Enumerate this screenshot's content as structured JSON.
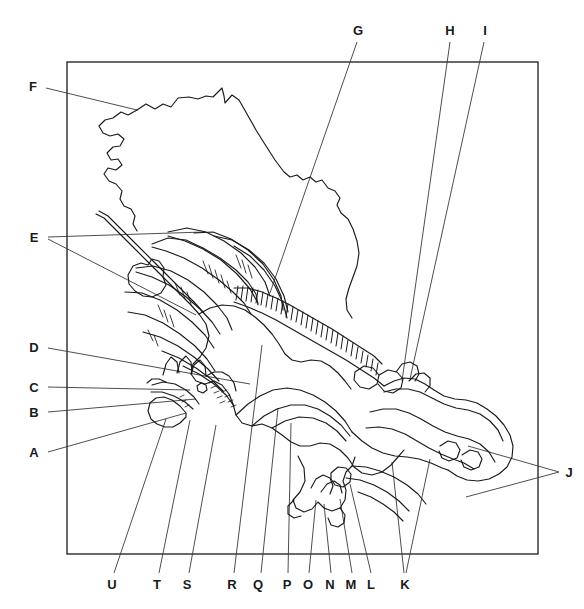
{
  "figure": {
    "type": "anatomical-line-drawing",
    "title": "",
    "caption": "",
    "style": {
      "background": "#ffffff",
      "line_color": "#1a1a1a",
      "leader_color": "#3a3a3a",
      "frame_color": "#2b2b2b"
    },
    "frame": {
      "x": 67,
      "y": 62,
      "width": 471,
      "height": 492
    },
    "labels": [
      {
        "id": "F",
        "text": "F",
        "x": 33,
        "y": 86,
        "position": "left"
      },
      {
        "id": "E",
        "text": "E",
        "x": 34,
        "y": 237,
        "position": "left"
      },
      {
        "id": "D",
        "text": "D",
        "x": 34,
        "y": 347,
        "position": "left"
      },
      {
        "id": "C",
        "text": "C",
        "x": 34,
        "y": 387,
        "position": "left"
      },
      {
        "id": "B",
        "text": "B",
        "x": 34,
        "y": 412,
        "position": "left"
      },
      {
        "id": "A",
        "text": "A",
        "x": 34,
        "y": 452,
        "position": "left"
      },
      {
        "id": "G",
        "text": "G",
        "x": 358,
        "y": 30,
        "position": "top"
      },
      {
        "id": "H",
        "text": "H",
        "x": 450,
        "y": 30,
        "position": "top"
      },
      {
        "id": "I",
        "text": "I",
        "x": 485,
        "y": 30,
        "position": "top"
      },
      {
        "id": "J",
        "text": "J",
        "x": 569,
        "y": 472,
        "position": "right"
      },
      {
        "id": "K",
        "text": "K",
        "x": 405,
        "y": 584,
        "position": "bottom"
      },
      {
        "id": "L",
        "text": "L",
        "x": 371,
        "y": 584,
        "position": "bottom"
      },
      {
        "id": "M",
        "text": "M",
        "x": 351,
        "y": 584,
        "position": "bottom"
      },
      {
        "id": "N",
        "text": "N",
        "x": 330,
        "y": 584,
        "position": "bottom"
      },
      {
        "id": "O",
        "text": "O",
        "x": 308,
        "y": 584,
        "position": "bottom"
      },
      {
        "id": "P",
        "text": "P",
        "x": 287,
        "y": 584,
        "position": "bottom"
      },
      {
        "id": "Q",
        "text": "Q",
        "x": 258,
        "y": 584,
        "position": "bottom"
      },
      {
        "id": "R",
        "text": "R",
        "x": 232,
        "y": 584,
        "position": "bottom"
      },
      {
        "id": "S",
        "text": "S",
        "x": 187,
        "y": 584,
        "position": "bottom"
      },
      {
        "id": "T",
        "text": "T",
        "x": 157,
        "y": 584,
        "position": "bottom"
      },
      {
        "id": "U",
        "text": "U",
        "x": 112,
        "y": 584,
        "position": "bottom"
      }
    ]
  }
}
